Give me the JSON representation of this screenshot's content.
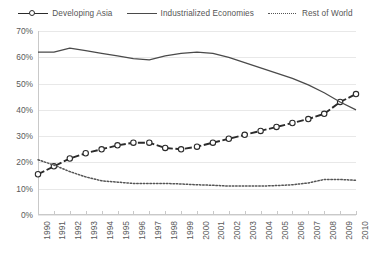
{
  "legend": {
    "position": "top-center",
    "items": [
      {
        "label": "Developing Asia",
        "style": "dashed-with-circle-markers",
        "color": "#2b2b2b",
        "icon": "line-marker-icon"
      },
      {
        "label": "Industrialized Economies",
        "style": "solid",
        "color": "#4a4a4a",
        "icon": "line-solid-icon"
      },
      {
        "label": "Rest of World",
        "style": "dotted",
        "color": "#555555",
        "icon": "line-dotted-icon"
      }
    ]
  },
  "axes": {
    "y_ticks": [
      "0%",
      "10%",
      "20%",
      "30%",
      "40%",
      "50%",
      "60%",
      "70%"
    ],
    "x_ticks": [
      "1990",
      "1991",
      "1992",
      "1993",
      "1994",
      "1995",
      "1996",
      "1997",
      "1998",
      "1999",
      "2000",
      "2001",
      "2002",
      "2003",
      "2004",
      "2005",
      "2006",
      "2007",
      "2008",
      "2009",
      "2010"
    ]
  },
  "chart_data": {
    "type": "line",
    "title": "",
    "xlabel": "",
    "ylabel": "",
    "ylim": [
      0,
      70
    ],
    "grid": true,
    "legend_position": "top-center",
    "categories": [
      "1990",
      "1991",
      "1992",
      "1993",
      "1994",
      "1995",
      "1996",
      "1997",
      "1998",
      "1999",
      "2000",
      "2001",
      "2002",
      "2003",
      "2004",
      "2005",
      "2006",
      "2007",
      "2008",
      "2009",
      "2010"
    ],
    "series": [
      {
        "name": "Developing Asia",
        "color": "#2b2b2b",
        "line_style": "dashed",
        "marker": "open-circle",
        "values": [
          15.5,
          18.5,
          21.5,
          23.5,
          25.0,
          26.5,
          27.5,
          27.5,
          25.5,
          25.0,
          26.0,
          27.5,
          29.0,
          30.5,
          32.0,
          33.5,
          35.0,
          36.5,
          38.5,
          43.0,
          46.0
        ]
      },
      {
        "name": "Industrialized Economies",
        "color": "#4a4a4a",
        "line_style": "solid",
        "marker": "none",
        "values": [
          62.0,
          62.0,
          63.5,
          62.5,
          61.5,
          60.5,
          59.5,
          59.0,
          60.5,
          61.5,
          62.0,
          61.5,
          60.0,
          58.0,
          56.0,
          54.0,
          52.0,
          49.5,
          46.5,
          43.0,
          40.0
        ]
      },
      {
        "name": "Rest of World",
        "color": "#555555",
        "line_style": "dotted",
        "marker": "none",
        "values": [
          21.0,
          19.0,
          16.5,
          14.5,
          13.0,
          12.5,
          12.0,
          12.0,
          12.0,
          11.8,
          11.5,
          11.3,
          11.0,
          11.0,
          11.0,
          11.2,
          11.5,
          12.2,
          13.5,
          13.5,
          13.2
        ]
      }
    ]
  }
}
